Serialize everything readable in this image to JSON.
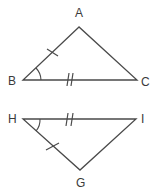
{
  "diagram": {
    "type": "congruent-triangles",
    "stroke_color": "#4a4a4a",
    "label_color": "#3a3a3a",
    "triangles": [
      {
        "name": "ABC",
        "vertices": {
          "A": {
            "label": "A",
            "x": 79,
            "y": 27
          },
          "B": {
            "label": "B",
            "x": 23,
            "y": 80
          },
          "C": {
            "label": "C",
            "x": 137,
            "y": 80
          }
        },
        "markings": {
          "single_tick_side": "AB",
          "double_tick_side": "BC",
          "angle_arc_vertex": "B"
        }
      },
      {
        "name": "GHI",
        "vertices": {
          "H": {
            "label": "H",
            "x": 23,
            "y": 119
          },
          "I": {
            "label": "I",
            "x": 136,
            "y": 119
          },
          "G": {
            "label": "G",
            "x": 80,
            "y": 170
          }
        },
        "markings": {
          "single_tick_side": "HG",
          "double_tick_side": "HI",
          "angle_arc_vertex": "H"
        }
      }
    ],
    "labels": {
      "A": "A",
      "B": "B",
      "C": "C",
      "H": "H",
      "I": "I",
      "G": "G"
    }
  }
}
